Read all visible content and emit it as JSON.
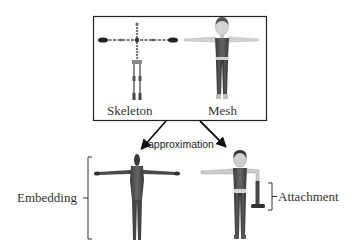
{
  "figure": {
    "top_panel": {
      "left_label": "Skeleton",
      "right_label": "Mesh"
    },
    "arrow_label": "approximation",
    "bottom_left_label": "Embedding",
    "bottom_right_label": "Attachment"
  },
  "colors": {
    "border": "#222222",
    "text": "#333333",
    "skeleton": "#555555",
    "skeleton_hands": "#222222",
    "mesh_body": "#6a6a6a",
    "mesh_skin": "#c8c8c8",
    "embedding_body": "#4a4a4a",
    "arrow": "#111111"
  }
}
